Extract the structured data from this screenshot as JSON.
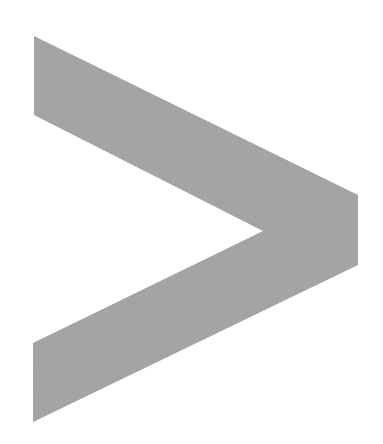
{
  "figure": {
    "icon": "chevron-right-icon",
    "glyph": ">",
    "fill_color": "#a3a3a3",
    "background_color": "#ffffff",
    "points": "34,36 358,195 358,265 33,422 33,343 263,231 34,115"
  }
}
